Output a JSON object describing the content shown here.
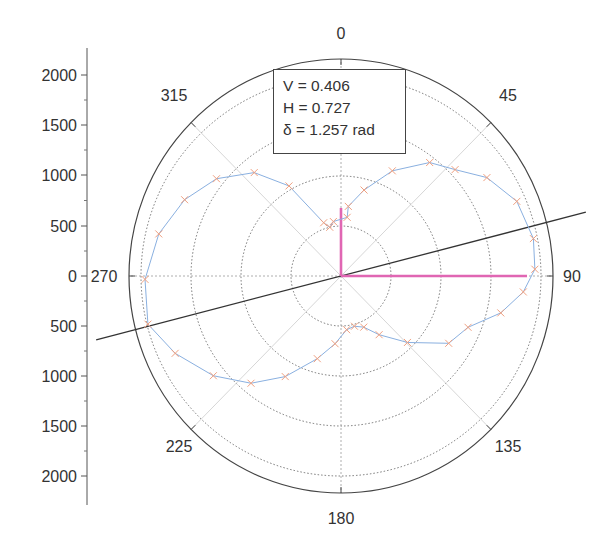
{
  "chart_data": {
    "type": "polar",
    "title": "",
    "angular_axis": {
      "direction": "clockwise",
      "zero_at": "top",
      "unit": "degrees",
      "tick_labels": [
        "0",
        "45",
        "90",
        "135",
        "180",
        "225",
        "270",
        "315"
      ],
      "tick_angles": [
        0,
        45,
        90,
        135,
        180,
        225,
        270,
        315
      ]
    },
    "radial_axis": {
      "tick_labels_upper": [
        "0",
        "500",
        "1000",
        "1500",
        "2000"
      ],
      "tick_labels_lower": [
        "500",
        "1000",
        "1500",
        "2000"
      ],
      "tick_values": [
        0,
        500,
        1000,
        1500,
        2000
      ],
      "range": [
        0,
        2150
      ],
      "grid_circles": [
        500,
        1000,
        1500,
        2000
      ]
    },
    "annotation": {
      "lines": [
        "V = 0.406",
        "H = 0.727",
        "δ = 1.257 rad"
      ],
      "V": 0.406,
      "H": 0.727,
      "delta_rad": 1.257
    },
    "series": [
      {
        "name": "measured",
        "marker": "x",
        "marker_color": "#f0a080",
        "line_color": "#8ab0e0",
        "points": [
          {
            "angle": 6,
            "r": 590
          },
          {
            "angle": 6,
            "r": 700
          },
          {
            "angle": 15,
            "r": 890
          },
          {
            "angle": 26,
            "r": 1170
          },
          {
            "angle": 38,
            "r": 1440
          },
          {
            "angle": 47,
            "r": 1560
          },
          {
            "angle": 56,
            "r": 1760
          },
          {
            "angle": 67,
            "r": 1910
          },
          {
            "angle": 79,
            "r": 1960
          },
          {
            "angle": 88,
            "r": 1940
          },
          {
            "angle": 95,
            "r": 1830
          },
          {
            "angle": 103,
            "r": 1640
          },
          {
            "angle": 112,
            "r": 1370
          },
          {
            "angle": 122,
            "r": 1270
          },
          {
            "angle": 135,
            "r": 940
          },
          {
            "angle": 147,
            "r": 700
          },
          {
            "angle": 156,
            "r": 560
          },
          {
            "angle": 165,
            "r": 520
          },
          {
            "angle": 174,
            "r": 540
          },
          {
            "angle": 185,
            "r": 680
          },
          {
            "angle": 196,
            "r": 860
          },
          {
            "angle": 209,
            "r": 1150
          },
          {
            "angle": 220,
            "r": 1400
          },
          {
            "angle": 232,
            "r": 1620
          },
          {
            "angle": 245,
            "r": 1830
          },
          {
            "angle": 256,
            "r": 1990
          },
          {
            "angle": 269,
            "r": 1960
          },
          {
            "angle": 283,
            "r": 1870
          },
          {
            "angle": 296,
            "r": 1740
          },
          {
            "angle": 308,
            "r": 1580
          },
          {
            "angle": 320,
            "r": 1350
          },
          {
            "angle": 330,
            "r": 1040
          },
          {
            "angle": 342,
            "r": 560
          },
          {
            "angle": 347,
            "r": 500
          },
          {
            "angle": 352,
            "r": 550
          }
        ]
      }
    ],
    "overlays": {
      "axis_line": {
        "angle_deg": 75.4,
        "color": "#333333"
      },
      "vectors": [
        {
          "name": "V",
          "angle": 0,
          "r": 680,
          "color": "#e066b3"
        },
        {
          "name": "H",
          "angle": 90,
          "r": 1860,
          "color": "#e066b3"
        }
      ]
    }
  },
  "geometry": {
    "cx": 341,
    "cy": 276,
    "rx": 212,
    "ry": 217,
    "px_per_unit_x": 0.1,
    "px_per_unit_y": 0.1,
    "yaxis_x": 87,
    "ytick_y": [
      75,
      125,
      175,
      226,
      276,
      326,
      376,
      426,
      476
    ]
  }
}
